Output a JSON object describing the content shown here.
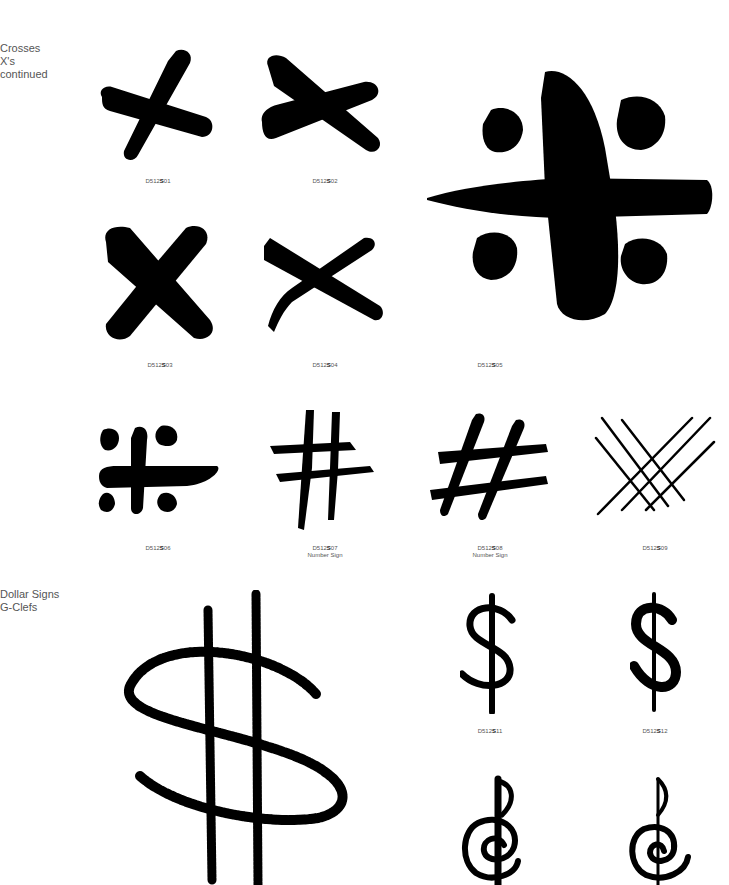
{
  "sections": [
    {
      "title_lines": [
        "Crosses",
        "X's",
        "continued"
      ]
    },
    {
      "title_lines": [
        "Dollar Signs",
        "G-Clefs"
      ]
    }
  ],
  "items": [
    {
      "code_prefix": "D512",
      "code_letter": "S",
      "code_num": "01",
      "subtitle": "",
      "icon": "brush-cross-x-icon"
    },
    {
      "code_prefix": "D512",
      "code_letter": "S",
      "code_num": "02",
      "subtitle": "",
      "icon": "brush-cross-x-icon"
    },
    {
      "code_prefix": "D512",
      "code_letter": "S",
      "code_num": "03",
      "subtitle": "",
      "icon": "bold-x-icon"
    },
    {
      "code_prefix": "D512",
      "code_letter": "S",
      "code_num": "04",
      "subtitle": "",
      "icon": "thin-x-icon"
    },
    {
      "code_prefix": "D512",
      "code_letter": "S",
      "code_num": "05",
      "subtitle": "",
      "icon": "cross-with-dots-icon"
    },
    {
      "code_prefix": "D512",
      "code_letter": "S",
      "code_num": "06",
      "subtitle": "",
      "icon": "cross-with-dots-icon"
    },
    {
      "code_prefix": "D512",
      "code_letter": "S",
      "code_num": "07",
      "subtitle": "Number Sign",
      "icon": "hash-icon"
    },
    {
      "code_prefix": "D512",
      "code_letter": "S",
      "code_num": "08",
      "subtitle": "Number Sign",
      "icon": "slanted-hash-icon"
    },
    {
      "code_prefix": "D512",
      "code_letter": "S",
      "code_num": "09",
      "subtitle": "",
      "icon": "crosshatch-icon"
    },
    {
      "code_prefix": "",
      "code_letter": "",
      "code_num": "",
      "subtitle": "",
      "icon": "chalk-dollar-sign-icon"
    },
    {
      "code_prefix": "D512",
      "code_letter": "S",
      "code_num": "11",
      "subtitle": "",
      "icon": "dollar-sign-icon"
    },
    {
      "code_prefix": "D512",
      "code_letter": "S",
      "code_num": "12",
      "subtitle": "",
      "icon": "dollar-sign-icon"
    },
    {
      "code_prefix": "",
      "code_letter": "",
      "code_num": "",
      "subtitle": "",
      "icon": "g-clef-icon"
    },
    {
      "code_prefix": "",
      "code_letter": "",
      "code_num": "",
      "subtitle": "",
      "icon": "g-clef-icon"
    }
  ],
  "colors": {
    "ink": "#000000",
    "caption": "#555555",
    "background": "#ffffff"
  }
}
